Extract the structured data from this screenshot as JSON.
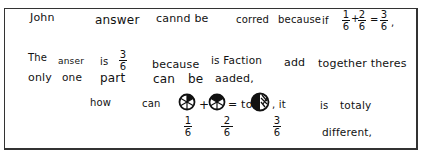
{
  "document": {
    "type": "handwritten-student-answer",
    "lines": [
      {
        "id": "line1",
        "segments": [
          "John",
          "answer",
          "cannd be",
          "corred",
          "because",
          "if"
        ]
      },
      {
        "id": "line2",
        "segments": [
          "The",
          "anser",
          "is",
          "because",
          "is Faction",
          "add",
          "together theres"
        ]
      },
      {
        "id": "line3",
        "segments": [
          "only",
          "one",
          "part",
          "can",
          "be",
          "aaded,"
        ]
      },
      {
        "id": "line4",
        "segments": [
          "how",
          "can",
          "+",
          "= to",
          ", it",
          "is",
          "totaly"
        ]
      },
      {
        "id": "line5",
        "segments": [
          "different,"
        ]
      }
    ],
    "equation_line1": {
      "a_num": "1",
      "a_den": "6",
      "op1": "+",
      "b_num": "2",
      "b_den": "6",
      "op2": "=",
      "c_num": "3",
      "c_den": "6",
      "end": ","
    },
    "answer_frac": {
      "num": "3",
      "den": "6"
    },
    "pie_labels": [
      {
        "num": "1",
        "den": "6"
      },
      {
        "num": "2",
        "den": "6"
      },
      {
        "num": "3",
        "den": "6"
      }
    ],
    "pies": [
      {
        "name": "one-sixth-pie",
        "slices": 6,
        "shaded": 1
      },
      {
        "name": "two-sixths-pie",
        "slices": 6,
        "shaded": 2
      },
      {
        "name": "three-sixths-pie",
        "slices": 6,
        "shaded": 3
      }
    ]
  }
}
